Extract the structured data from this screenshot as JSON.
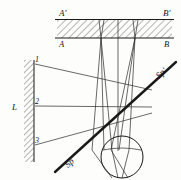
{
  "diagram": {
    "type": "ray-optics-schematic",
    "stroke_color": "#1a1a1a",
    "hatch_color": "#555555",
    "background": "#fdfdfc",
    "labels": {
      "plate_top_left": "A'",
      "plate_top_right": "B'",
      "plate_bottom_left": "A",
      "plate_bottom_right": "B",
      "wall": "L",
      "ray_1": "1",
      "ray_2": "2",
      "ray_3": "3",
      "plane_lower": "Sp",
      "plane_upper": "Sp'"
    },
    "elements": {
      "plate": {
        "name": "hatched-plate",
        "x": 57,
        "y": 19,
        "width": 115,
        "height": 19,
        "hatch_angle_deg": 45
      },
      "wall": {
        "name": "hatched-wall",
        "x": 24,
        "y": 60,
        "width": 10,
        "height": 102,
        "hatch_angle_deg": 45
      },
      "lens_circle": {
        "name": "lens",
        "cx": 122,
        "cy": 157,
        "r": 21
      },
      "oblique_plane": {
        "name": "oblique-plane-line",
        "x1": 55,
        "y1": 172,
        "x2": 176,
        "y2": 62,
        "thickness": 2.2
      }
    },
    "rays": {
      "numbered_rays": [
        {
          "id": "1",
          "x1": 35,
          "y1": 64,
          "x2": 152,
          "y2": 90
        },
        {
          "id": "2",
          "x1": 35,
          "y1": 106,
          "x2": 152,
          "y2": 107
        },
        {
          "id": "3",
          "x1": 35,
          "y1": 145,
          "x2": 152,
          "y2": 113
        }
      ],
      "bundle_left_origin": {
        "x": 101,
        "y": 38
      },
      "bundle_right_origin": {
        "x": 135,
        "y": 38
      },
      "bundle_focus": {
        "x": 122,
        "y": 150
      },
      "axis_vertical": {
        "x": 118,
        "y1": 19,
        "y2": 150
      }
    }
  }
}
